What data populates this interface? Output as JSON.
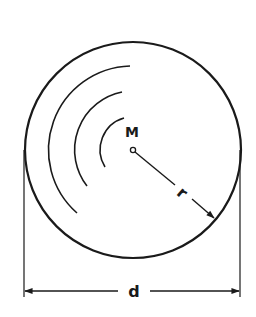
{
  "diagram": {
    "type": "circle-geometry",
    "stroke_color": "#1a1a1a",
    "background": "#ffffff",
    "labels": {
      "center": "M",
      "radius": "r",
      "diameter": "d"
    },
    "circle": {
      "cx": 133,
      "cy": 150,
      "r": 108
    },
    "concentric_arcs": 3,
    "dimension": {
      "y": 291,
      "x1": 24,
      "x2": 240
    }
  }
}
